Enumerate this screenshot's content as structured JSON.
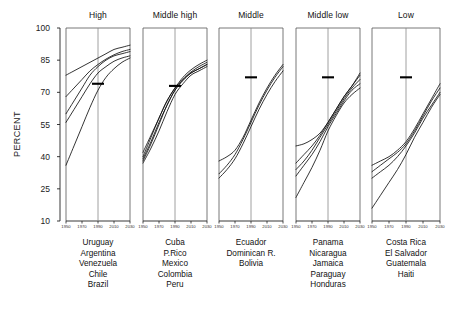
{
  "figure": {
    "ylabel": "PERCENT",
    "yticks": [
      100,
      85,
      70,
      55,
      40,
      25,
      10
    ],
    "xticks": [
      "1950",
      "1970",
      "1990",
      "2010",
      "2030"
    ]
  },
  "panels": [
    {
      "title": "High",
      "countries": [
        "Uruguay",
        "Argentina",
        "Venezuela",
        "Chile",
        "Brazil"
      ]
    },
    {
      "title": "Middle high",
      "countries": [
        "Cuba",
        "P.Rico",
        "Mexico",
        "Colombia",
        "Peru"
      ]
    },
    {
      "title": "Middle",
      "countries": [
        "Ecuador",
        "Dominican R.",
        "Bolivia"
      ]
    },
    {
      "title": "Middle low",
      "countries": [
        "Panama",
        "Nicaragua",
        "Jamaica",
        "Paraguay",
        "Honduras"
      ]
    },
    {
      "title": "Low",
      "countries": [
        "Costa Rica",
        "El Salvador",
        "Guatemala",
        "Haiti"
      ]
    }
  ],
  "chart_data": {
    "type": "line",
    "title": "",
    "xlabel": "",
    "ylabel": "PERCENT",
    "xlim": [
      1950,
      2030
    ],
    "ylim": [
      10,
      100
    ],
    "ytick_values": [
      10,
      25,
      40,
      55,
      70,
      85,
      100
    ],
    "xtick_values": [
      1950,
      1970,
      1990,
      2010,
      2030
    ],
    "grid": "vertical gridline at 1990 in each panel",
    "legend": "none; series labelled by country list beneath each panel",
    "annotation": "short horizontal bar marks the 1990 regional value in each panel",
    "x": [
      1950,
      1960,
      1970,
      1980,
      1990,
      2000,
      2010,
      2020,
      2030
    ],
    "panels": [
      {
        "group": "High",
        "marker_1990": 74,
        "series": [
          {
            "name": "Uruguay",
            "values": [
              78,
              80,
              82,
              84,
              86,
              88,
              90,
              91,
              92
            ]
          },
          {
            "name": "Argentina",
            "values": [
              68,
              72,
              76,
              80,
              83,
              85.5,
              87.5,
              89,
              90
            ]
          },
          {
            "name": "Venezuela",
            "values": [
              60,
              66,
              72,
              78,
              82,
              85,
              87,
              88,
              89
            ]
          },
          {
            "name": "Chile",
            "values": [
              56,
              62,
              68,
              74,
              79,
              82,
              84.5,
              86,
              87
            ]
          },
          {
            "name": "Brazil",
            "values": [
              36,
              45,
              54,
              63,
              71,
              77,
              81,
              84,
              86
            ]
          }
        ]
      },
      {
        "group": "Middle high",
        "marker_1990": 73,
        "series": [
          {
            "name": "Cuba",
            "values": [
              42,
              50,
              58,
              66,
              72,
              76,
              79,
              81,
              83
            ]
          },
          {
            "name": "P.Rico",
            "values": [
              40,
              49,
              58,
              66,
              72,
              77,
              80.5,
              83,
              85
            ]
          },
          {
            "name": "Mexico",
            "values": [
              39,
              47,
              56,
              64,
              71,
              75.5,
              79,
              81,
              83
            ]
          },
          {
            "name": "Colombia",
            "values": [
              38,
              46,
              55,
              64,
              71,
              76,
              79.5,
              82,
              84
            ]
          },
          {
            "name": "Peru",
            "values": [
              37,
              44,
              52,
              61,
              69,
              74,
              78,
              80,
              82
            ]
          }
        ]
      },
      {
        "group": "Middle",
        "marker_1990": 77,
        "series": [
          {
            "name": "Ecuador",
            "values": [
              38,
              40,
              43,
              49,
              57,
              65,
              72,
              78,
              83
            ]
          },
          {
            "name": "Dominican R.",
            "values": [
              32,
              36,
              41,
              48,
              56,
              64,
              71,
              77,
              82
            ]
          },
          {
            "name": "Bolivia",
            "values": [
              30,
              34,
              39,
              46,
              54,
              62,
              69,
              75,
              80
            ]
          }
        ]
      },
      {
        "group": "Middle low",
        "marker_1990": 77,
        "series": [
          {
            "name": "Panama",
            "values": [
              45,
              46,
              48,
              51,
              56,
              62,
              68,
              73,
              78
            ]
          },
          {
            "name": "Nicaragua",
            "values": [
              37,
              41,
              45,
              50,
              56,
              62,
              68,
              73,
              79
            ]
          },
          {
            "name": "Jamaica",
            "values": [
              34,
              38,
              43,
              49,
              55,
              61,
              67,
              72,
              76
            ]
          },
          {
            "name": "Paraguay",
            "values": [
              31,
              36,
              41,
              47,
              54,
              60,
              66,
              71,
              74
            ]
          },
          {
            "name": "Honduras",
            "values": [
              21,
              28,
              35,
              43,
              52,
              59,
              65,
              69,
              72
            ]
          }
        ]
      },
      {
        "group": "Low",
        "marker_1990": 77,
        "series": [
          {
            "name": "Costa Rica",
            "values": [
              36,
              38,
              40,
              43,
              47,
              53,
              60,
              67,
              74
            ]
          },
          {
            "name": "El Salvador",
            "values": [
              33,
              36,
              39,
              42,
              46,
              52,
              59,
              66,
              72
            ]
          },
          {
            "name": "Guatemala",
            "values": [
              30,
              33,
              36,
              40,
              45,
              51,
              58,
              64,
              70
            ]
          },
          {
            "name": "Haiti",
            "values": [
              16,
              22,
              28,
              34,
              41,
              49,
              56,
              63,
              69
            ]
          }
        ]
      }
    ]
  }
}
